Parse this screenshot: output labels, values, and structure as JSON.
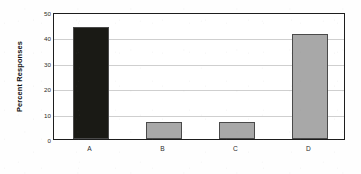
{
  "chart_data": {
    "type": "bar",
    "title": "",
    "xlabel": "",
    "ylabel": "Percent Responses",
    "categories": [
      "A",
      "B",
      "C",
      "D"
    ],
    "values": [
      44,
      6.7,
      6.6,
      41.5
    ],
    "series": [
      {
        "name": "Percent Responses",
        "values": [
          44,
          6.7,
          6.6,
          41.5
        ]
      }
    ],
    "bar_colors": [
      "#1a1a15",
      "#a8a8a8",
      "#a8a8a8",
      "#a8a8a8"
    ],
    "bar_border_color": "#4a4a4a",
    "ylim": [
      0,
      50
    ],
    "ytick_labels": [
      "0",
      "10",
      "20",
      "30",
      "40",
      "50"
    ],
    "ytick_values": [
      0,
      10,
      20,
      30,
      40,
      50
    ],
    "grid": true,
    "grid_color": "#cfcfcf",
    "legend": "none",
    "frame_color": "#1d1d1d",
    "background_color": "#ffffff"
  }
}
